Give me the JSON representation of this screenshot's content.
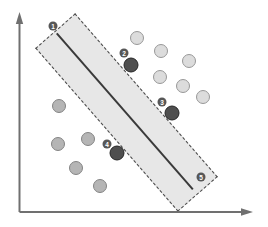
{
  "diagram": {
    "kind": "svm-margin-illustration",
    "band": {
      "cx": 126,
      "cy": 112,
      "length": 217,
      "width": 53,
      "angle_deg": 48.9
    },
    "badges": [
      {
        "label": "1",
        "x": 53,
        "y": 26
      },
      {
        "label": "2",
        "x": 124,
        "y": 53
      },
      {
        "label": "3",
        "x": 162,
        "y": 102
      },
      {
        "label": "4",
        "x": 107,
        "y": 144
      },
      {
        "label": "5",
        "x": 201,
        "y": 177
      }
    ],
    "points": [
      {
        "class": "class-a",
        "x": 137,
        "y": 38
      },
      {
        "class": "class-a",
        "x": 161,
        "y": 51
      },
      {
        "class": "class-a",
        "x": 189,
        "y": 61
      },
      {
        "class": "class-a",
        "x": 160,
        "y": 77
      },
      {
        "class": "class-a",
        "x": 183,
        "y": 86
      },
      {
        "class": "class-a",
        "x": 203,
        "y": 97
      },
      {
        "class": "class-b",
        "x": 59,
        "y": 106
      },
      {
        "class": "class-b",
        "x": 58,
        "y": 144
      },
      {
        "class": "class-b",
        "x": 88,
        "y": 139
      },
      {
        "class": "class-b",
        "x": 76,
        "y": 168
      },
      {
        "class": "class-b",
        "x": 100,
        "y": 186
      },
      {
        "class": "support-vector",
        "x": 131,
        "y": 65
      },
      {
        "class": "support-vector",
        "x": 172,
        "y": 113
      },
      {
        "class": "support-vector",
        "x": 117,
        "y": 153
      }
    ]
  },
  "colors": {
    "band_fill": "#e7e7e7",
    "band_border": "#4a4a4a",
    "decision_line": "#3a3a3a",
    "axis": "#707070",
    "class_a_fill": "#dcdcdc",
    "class_b_fill": "#b5b5b5",
    "support_vector_fill": "#4f4f4f",
    "badge_fill": "#575757",
    "badge_text": "#ffffff"
  }
}
